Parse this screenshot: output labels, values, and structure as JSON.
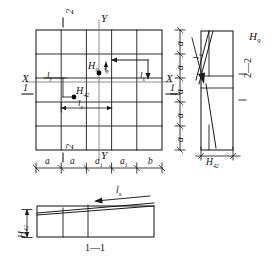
{
  "drawing": {
    "title_section_1": "1—1",
    "title_section_2": "2—2",
    "axis_x_left": "X",
    "axis_x_right": "X",
    "axis_y_top": "Y",
    "axis_y_bottom": "Y",
    "section_mark_1_left": "1",
    "section_mark_1_right": "1",
    "section_mark_2_top": "2",
    "section_mark_2_bottom": "2"
  },
  "plan": {
    "point_upper": {
      "label": "H",
      "sub": "9"
    },
    "point_lower": {
      "label": "H",
      "sub": "42"
    },
    "dim_lx_lower": {
      "label": "l",
      "sub": "x"
    },
    "dim_ly_left": {
      "label": "l",
      "sub": "y"
    },
    "dim_ly_point": {
      "label": "l",
      "sub": "y"
    },
    "arrow_lx_right": {
      "label": "l",
      "sub": "x"
    },
    "grid_cols": 5,
    "grid_rows": 5
  },
  "dim_chain_bottom": {
    "segments": [
      {
        "label": "a",
        "sub": ""
      },
      {
        "label": "a",
        "sub": ""
      },
      {
        "label": "a",
        "sub": "1"
      },
      {
        "label": "a",
        "sub": "1"
      },
      {
        "label": "b",
        "sub": ""
      }
    ]
  },
  "dim_chain_right": {
    "segments": [
      {
        "label": "a",
        "sub": ""
      },
      {
        "label": "a",
        "sub": ""
      },
      {
        "label": "a",
        "sub": ""
      },
      {
        "label": "a",
        "sub": ""
      },
      {
        "label": "a",
        "sub": ""
      }
    ]
  },
  "section_2_2": {
    "height_label": {
      "label": "H",
      "sub": "9"
    },
    "base_dim": {
      "label": "H",
      "sub": "42"
    },
    "slope_label": {
      "label": "l",
      "sub": "y"
    },
    "caption": "2—2"
  },
  "section_1_1": {
    "height_label": {
      "label": "H",
      "sub": "42"
    },
    "slope_label": {
      "label": "l",
      "sub": "x"
    },
    "caption": "1—1"
  },
  "colors": {
    "line": "#1a1a1a",
    "thin": "#4a4a4a",
    "point": "#000000",
    "background": "#ffffff"
  }
}
